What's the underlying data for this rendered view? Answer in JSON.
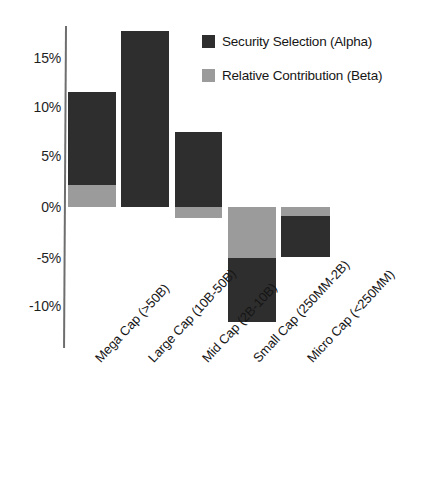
{
  "chart_data": {
    "type": "bar",
    "subtype": "stacked-bar-positive-negative",
    "title": "",
    "xlabel": "",
    "ylabel": "",
    "ylim": [
      -12.5,
      18.5
    ],
    "yticks": [
      15,
      10,
      5,
      0,
      -5,
      -10
    ],
    "ytick_labels": [
      "15%",
      "10%",
      "5%",
      "0%",
      "-5%",
      "-10%"
    ],
    "grid": false,
    "legend_position": "upper-right",
    "categories": [
      "Mega Cap (>50B)",
      "Large Cap (10B-50B)",
      "Mid Cap (2B-10B)",
      "Small Cap (250MM-2B)",
      "Micro Cap (<250MM)"
    ],
    "series": [
      {
        "name": "Security Selection (Alpha)",
        "color": "#2e2e2e",
        "values": [
          9.3,
          17.8,
          7.6,
          -6.5,
          -4.1
        ]
      },
      {
        "name": "Relative Contribution (Beta)",
        "color": "#9b9b9b",
        "values": [
          2.2,
          0.0,
          -1.1,
          -5.1,
          -0.9
        ]
      }
    ],
    "totals": [
      11.5,
      17.8,
      6.5,
      -11.6,
      -5.0
    ]
  },
  "legend": {
    "items": [
      {
        "label": "Security Selection (Alpha)",
        "swatch": "alpha"
      },
      {
        "label": "Relative Contribution (Beta)",
        "swatch": "beta"
      }
    ]
  },
  "axis": {
    "ticks": [
      {
        "label": "15%",
        "top": 50
      },
      {
        "label": "10%",
        "top": 99
      },
      {
        "label": "5%",
        "top": 148
      },
      {
        "label": "0%",
        "top": 199
      },
      {
        "label": "-5%",
        "top": 250
      },
      {
        "label": "-10%",
        "top": 298
      }
    ]
  },
  "bars": [
    {
      "name": "mega-cap",
      "left": 68,
      "width": 48,
      "segments": [
        {
          "kind": "alpha",
          "top": 92,
          "height": 93
        },
        {
          "kind": "beta",
          "top": 185,
          "height": 22
        }
      ]
    },
    {
      "name": "large-cap",
      "left": 121,
      "width": 48,
      "segments": [
        {
          "kind": "alpha",
          "top": 31,
          "height": 176
        }
      ]
    },
    {
      "name": "mid-cap",
      "left": 175,
      "width": 47,
      "segments": [
        {
          "kind": "alpha",
          "top": 132,
          "height": 75
        },
        {
          "kind": "beta",
          "top": 207,
          "height": 11
        }
      ]
    },
    {
      "name": "small-cap",
      "left": 228,
      "width": 48,
      "segments": [
        {
          "kind": "beta",
          "top": 207,
          "height": 51
        },
        {
          "kind": "alpha",
          "top": 258,
          "height": 64
        }
      ]
    },
    {
      "name": "micro-cap",
      "left": 281,
      "width": 49,
      "segments": [
        {
          "kind": "beta",
          "top": 207,
          "height": 9
        },
        {
          "kind": "alpha",
          "top": 216,
          "height": 41
        }
      ]
    }
  ],
  "category_labels": [
    {
      "text": "Mega Cap (>50B)",
      "left": 92,
      "top": 355
    },
    {
      "text": "Large Cap (10B-50B)",
      "left": 145,
      "top": 355
    },
    {
      "text": "Mid Cap (2B-10B)",
      "left": 199,
      "top": 355
    },
    {
      "text": "Small Cap (250MM-2B)",
      "left": 250,
      "top": 355
    },
    {
      "text": "Micro Cap (<250MM)",
      "left": 304,
      "top": 355
    }
  ]
}
